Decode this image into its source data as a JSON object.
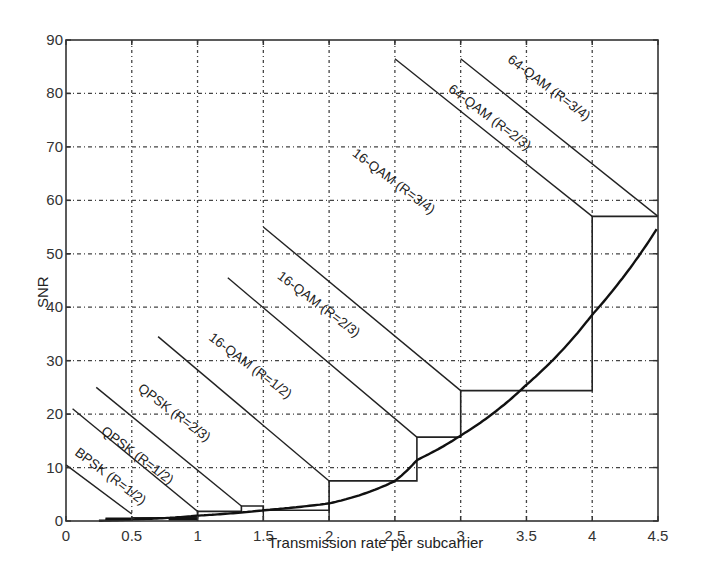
{
  "chart_data": {
    "type": "line",
    "title": "",
    "xlabel": "Transmission rate per subcarrier",
    "ylabel": "SNR",
    "xlim": [
      0,
      4.5
    ],
    "ylim": [
      0,
      90
    ],
    "grid": true,
    "legend": "none (inline labels)",
    "x_ticks": [
      0,
      0.5,
      1,
      1.5,
      2,
      2.5,
      3,
      3.5,
      4,
      4.5
    ],
    "x_tick_labels": [
      "0",
      "0.5",
      "1",
      "1.5",
      "2",
      "2.5",
      "3",
      "3.5",
      "4",
      "4.5"
    ],
    "y_ticks": [
      0,
      10,
      20,
      30,
      40,
      50,
      60,
      70,
      80,
      90
    ],
    "y_tick_labels": [
      "0",
      "10",
      "20",
      "30",
      "40",
      "50",
      "60",
      "70",
      "80",
      "90"
    ],
    "capacity_curve": {
      "name": "SNR required (capacity bound)",
      "x": [
        0,
        0.5,
        1,
        1.5,
        2,
        2.5,
        2.667,
        3,
        3.5,
        4,
        4.5
      ],
      "y": [
        0,
        0.3,
        1.0,
        2.0,
        3.3,
        7.5,
        11.4,
        16.0,
        25.5,
        38.6,
        55.0
      ]
    },
    "mode_lines": [
      {
        "label": "BPSK (R=1/2)",
        "x": [
          0,
          0.5
        ],
        "y": [
          10.5,
          1.3
        ]
      },
      {
        "label": "QPSK (R=1/2)",
        "x": [
          0.05,
          1.0
        ],
        "y": [
          21.0,
          1.8
        ]
      },
      {
        "label": "QPSK (R=2/3)",
        "x": [
          0.23,
          1.333
        ],
        "y": [
          25.0,
          2.8
        ]
      },
      {
        "label": "16-QAM (R=1/2)",
        "x": [
          0.7,
          2.0
        ],
        "y": [
          34.5,
          7.5
        ]
      },
      {
        "label": "16-QAM (R=2/3)",
        "x": [
          1.23,
          2.667
        ],
        "y": [
          45.5,
          15.7
        ]
      },
      {
        "label": "16-QAM (R=3/4)",
        "x": [
          1.5,
          3.0
        ],
        "y": [
          55.0,
          24.4
        ]
      },
      {
        "label": "64-QAM (R=2/3)",
        "x": [
          2.5,
          4.0
        ],
        "y": [
          86.5,
          57.0
        ]
      },
      {
        "label": "64-QAM (R=3/4)",
        "x": [
          3.0,
          4.5
        ],
        "y": [
          86.5,
          57.0
        ]
      }
    ],
    "steps": {
      "name": "Adaptive modulation staircase",
      "x": [
        0.3,
        0.5,
        0.5,
        1.0,
        1.0,
        1.333,
        1.333,
        1.5,
        1.5,
        2.0,
        2.0,
        2.667,
        2.667,
        3.0,
        3.0,
        4.0,
        4.0,
        4.5
      ],
      "y": [
        0.3,
        0.3,
        0.6,
        0.6,
        1.8,
        1.8,
        2.8,
        2.8,
        2.0,
        2.0,
        7.5,
        7.5,
        15.7,
        15.7,
        24.4,
        24.4,
        57.0,
        57.0
      ]
    },
    "label_positions": [
      {
        "label": "BPSK (R=1/2)",
        "x": 0.06,
        "y": 12.5,
        "angle": 37
      },
      {
        "label": "QPSK (R=1/2)",
        "x": 0.26,
        "y": 16.5,
        "angle": 37
      },
      {
        "label": "QPSK (R=2/3)",
        "x": 0.54,
        "y": 24.5,
        "angle": 37
      },
      {
        "label": "16-QAM (R=1/2)",
        "x": 1.08,
        "y": 34.0,
        "angle": 37
      },
      {
        "label": "16-QAM (R=2/3)",
        "x": 1.6,
        "y": 45.5,
        "angle": 37
      },
      {
        "label": "16-QAM (R=3/4)",
        "x": 2.17,
        "y": 68.5,
        "angle": 37
      },
      {
        "label": "64-QAM (R=2/3)",
        "x": 2.9,
        "y": 80.5,
        "angle": 37
      },
      {
        "label": "64-QAM (R=3/4)",
        "x": 3.35,
        "y": 86.0,
        "angle": 37
      }
    ]
  },
  "plot_area": {
    "left": 66,
    "top": 40,
    "right": 658,
    "bottom": 521
  }
}
